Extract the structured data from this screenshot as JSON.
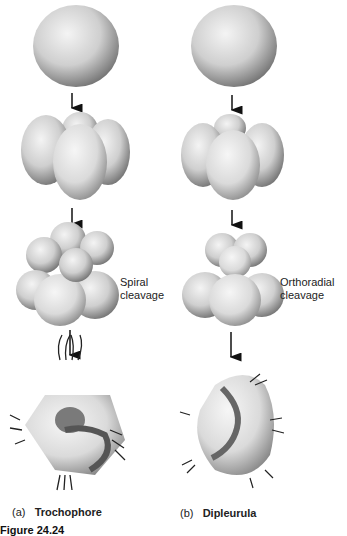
{
  "figure": {
    "columns": [
      {
        "id": "a",
        "letter": "(a)",
        "name": "Trochophore",
        "stages": [
          "zygote",
          "4-cell",
          "8-cell spiral",
          "trochophore larva"
        ],
        "cleavage_label_1": "Spiral",
        "cleavage_label_2": "cleavage"
      },
      {
        "id": "b",
        "letter": "(b)",
        "name": "Dipleurula",
        "stages": [
          "zygote",
          "4-cell",
          "8-cell orthoradial",
          "dipleurula larva"
        ],
        "cleavage_label_1": "Orthoradial",
        "cleavage_label_2": "cleavage"
      }
    ],
    "caption_partial": "Figure 24.24"
  },
  "colors": {
    "background": "#ffffff",
    "cell_light": "#e8e8e8",
    "cell_dark": "#7a7a7a",
    "arrow": "#111111"
  }
}
